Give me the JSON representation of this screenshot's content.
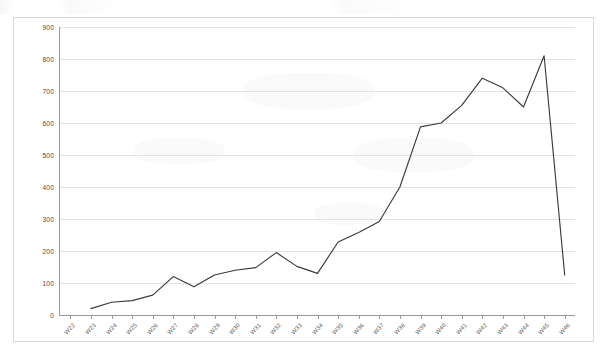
{
  "chart_data": {
    "type": "line",
    "title": "",
    "subtitle": "",
    "xlabel": "",
    "ylabel": "",
    "categories": [
      "W22",
      "W23",
      "W24",
      "W25",
      "W26",
      "W27",
      "W28",
      "W29",
      "W30",
      "W31",
      "W32",
      "W33",
      "W34",
      "W35",
      "W36",
      "W37",
      "W38",
      "W39",
      "W40",
      "W41",
      "W42",
      "W43",
      "W44",
      "W45",
      "W46"
    ],
    "series": [
      {
        "name": "",
        "values": [
          null,
          20,
          40,
          45,
          62,
          120,
          88,
          125,
          140,
          148,
          195,
          152,
          130,
          228,
          258,
          292,
          400,
          588,
          600,
          655,
          740,
          710,
          650,
          810,
          125
        ]
      }
    ],
    "ytick_labels": [
      "900",
      "800",
      "700",
      "600",
      "500",
      "400",
      "300",
      "200",
      "100",
      "0"
    ],
    "ytick_values": [
      900,
      800,
      700,
      600,
      500,
      400,
      300,
      200,
      100,
      0
    ],
    "ylim": [
      0,
      900
    ],
    "ystep": 100,
    "grid": "horizontal",
    "legend": "none",
    "line_color": "#3b3b3b",
    "grid_color": "#e3e3e3",
    "axis_color": "#9a9a9a",
    "border_color": "#d8d8d8",
    "background_color": "#ffffff",
    "annotations": []
  }
}
